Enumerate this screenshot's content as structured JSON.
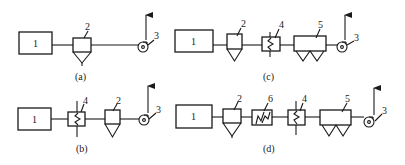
{
  "diagram": {
    "type": "process flow schematic (dust removal systems)",
    "panels": [
      {
        "caption": "(a)",
        "components": [
          "1",
          "2",
          "3"
        ]
      },
      {
        "caption": "(b)",
        "components": [
          "1",
          "4",
          "2",
          "3"
        ]
      },
      {
        "caption": "(c)",
        "components": [
          "1",
          "2",
          "4",
          "5",
          "3"
        ]
      },
      {
        "caption": "(d)",
        "components": [
          "1",
          "2",
          "6",
          "4",
          "5",
          "3"
        ]
      }
    ],
    "labels": {
      "furnace": "1",
      "cyclone": "2",
      "fan": "3",
      "heat_exchanger": "4",
      "bag_filter": "5",
      "spark_arrester": "6"
    },
    "colors": {
      "line": "#1a1a1a",
      "background": "#ffffff"
    }
  }
}
